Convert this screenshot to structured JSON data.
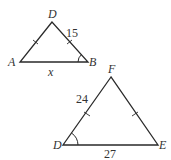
{
  "diagram": {
    "type": "similar-triangles",
    "triangle_1": {
      "vertices": {
        "D": "D",
        "A": "A",
        "B": "B"
      },
      "side_DB": "15",
      "side_AB": "x",
      "marked_angle": "B",
      "tick_marked_sides": [
        "AD",
        "DB"
      ]
    },
    "triangle_2": {
      "vertices": {
        "F": "F",
        "D": "D",
        "E": "E"
      },
      "side_DF": "24",
      "side_DE": "27",
      "marked_angle": "D",
      "tick_marked_sides": [
        "DF",
        "FE"
      ]
    }
  },
  "colors": {
    "stroke": "#2a2a2a",
    "label": "#333333",
    "background": "#ffffff"
  }
}
